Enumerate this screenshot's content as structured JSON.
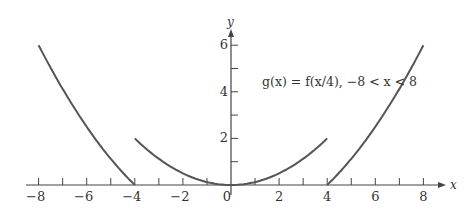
{
  "chart_data": {
    "type": "line",
    "title": "",
    "annotation": "g(x) = f(x/4), −8 < x < 8",
    "xlabel": "x",
    "ylabel": "y",
    "xlim": [
      -8.5,
      8.5
    ],
    "ylim": [
      0,
      6.5
    ],
    "x_ticks": [
      -8,
      -7,
      -6,
      -5,
      -4,
      -3,
      -2,
      -1,
      0,
      1,
      2,
      3,
      4,
      5,
      6,
      7,
      8
    ],
    "x_tick_labels": [
      "−8",
      "−6",
      "−4",
      "−2",
      "0",
      "2",
      "4",
      "6",
      "8"
    ],
    "y_ticks": [
      1,
      2,
      3,
      4,
      5,
      6
    ],
    "y_tick_labels": [
      "2",
      "4",
      "6"
    ],
    "grid": false,
    "legend": null,
    "series": [
      {
        "name": "left branch",
        "x": [
          -8,
          -7,
          -6,
          -5,
          -4
        ],
        "y": [
          6,
          4.1,
          2.5,
          1.1,
          0
        ]
      },
      {
        "name": "middle parabola",
        "x": [
          -4,
          -3,
          -2,
          -1,
          0,
          1,
          2,
          3,
          4
        ],
        "y": [
          2,
          1.125,
          0.5,
          0.125,
          0,
          0.125,
          0.5,
          1.125,
          2
        ]
      },
      {
        "name": "right branch",
        "x": [
          4,
          5,
          6,
          7,
          8
        ],
        "y": [
          0,
          1.1,
          2.5,
          4.1,
          6
        ]
      }
    ],
    "color": "#555555"
  }
}
